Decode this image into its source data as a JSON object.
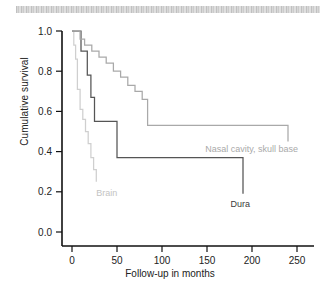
{
  "figure": {
    "top_band": "scanned-page-edge-artifact"
  },
  "chart_data": {
    "type": "line",
    "title": "",
    "xlabel": "Follow-up in months",
    "ylabel": "Cumulative survival",
    "xlim": [
      0,
      262
    ],
    "ylim": [
      0.0,
      1.04
    ],
    "xticks": [
      0,
      50,
      100,
      150,
      200,
      250
    ],
    "xtick_labels": [
      "0",
      "50",
      "100",
      "150",
      "200",
      "250"
    ],
    "yticks": [
      0.0,
      0.2,
      0.4,
      0.6,
      0.8,
      1.0
    ],
    "ytick_labels": [
      "0.0",
      "0.2",
      "0.4",
      "0.6",
      "0.8",
      "1.0"
    ],
    "grid": false,
    "legend": "inline-annotations",
    "step_style": "post",
    "series": [
      {
        "name": "Brain",
        "color": "#cfcfcf",
        "label_color": "#c3c3c3",
        "label_x": 27,
        "label_y": 0.18,
        "x": [
          0,
          2,
          4,
          6,
          9,
          12,
          15,
          18,
          21,
          24,
          27
        ],
        "y": [
          1.0,
          0.93,
          0.86,
          0.71,
          0.61,
          0.56,
          0.5,
          0.44,
          0.37,
          0.31,
          0.25
        ]
      },
      {
        "name": "Dura",
        "color": "#555555",
        "label_color": "#3a3a3a",
        "label_x": 176,
        "label_y": 0.125,
        "x": [
          0,
          8,
          10,
          14,
          17,
          21,
          25,
          31,
          50,
          190
        ],
        "y": [
          1.0,
          1.0,
          0.9,
          0.9,
          0.78,
          0.67,
          0.55,
          0.55,
          0.37,
          0.19
        ]
      },
      {
        "name": "Nasal cavity, skull base",
        "color": "#a9a9a9",
        "label_color": "#a9a9a9",
        "label_x": 148,
        "label_y": 0.4,
        "x": [
          0,
          5,
          9,
          14,
          22,
          30,
          38,
          46,
          54,
          62,
          70,
          78,
          84,
          140,
          240
        ],
        "y": [
          1.0,
          1.0,
          0.96,
          0.93,
          0.9,
          0.87,
          0.84,
          0.8,
          0.77,
          0.73,
          0.7,
          0.66,
          0.53,
          0.53,
          0.45
        ]
      }
    ]
  }
}
